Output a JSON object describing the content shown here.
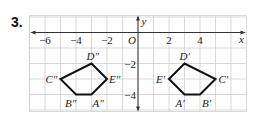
{
  "problem": {
    "number": "3."
  },
  "colors": {
    "grid": "#cfcfcf",
    "axis": "#333333",
    "shape": "#111111",
    "label": "#222222"
  },
  "chart_data": {
    "type": "coordinate-plane",
    "grid": {
      "x_min": -7,
      "x_max": 7,
      "y_min": -5,
      "y_max": 1,
      "on": true
    },
    "axes": {
      "x_label": "x",
      "y_label": "y",
      "origin_label": "O"
    },
    "x_tick_labels": [
      {
        "value": -6,
        "label": "−6"
      },
      {
        "value": -4,
        "label": "−4"
      },
      {
        "value": -2,
        "label": "−2"
      },
      {
        "value": 2,
        "label": "2"
      },
      {
        "value": 4,
        "label": "4"
      }
    ],
    "y_tick_labels": [
      {
        "value": -2,
        "label": "−2"
      },
      {
        "value": -4,
        "label": "−4"
      }
    ],
    "polygons": [
      {
        "name": "A′B′C′D′E′",
        "vertices": [
          {
            "label": "A′",
            "x": 3,
            "y": -4,
            "lx": -9,
            "ly": 12
          },
          {
            "label": "B′",
            "x": 4,
            "y": -4,
            "lx": 2,
            "ly": 12
          },
          {
            "label": "C′",
            "x": 5,
            "y": -3,
            "lx": 3,
            "ly": 4
          },
          {
            "label": "D′",
            "x": 3,
            "y": -2,
            "lx": -5,
            "ly": -4
          },
          {
            "label": "E′",
            "x": 2,
            "y": -3,
            "lx": -13,
            "ly": 4
          }
        ]
      },
      {
        "name": "A″B″C″D″E″",
        "vertices": [
          {
            "label": "A″",
            "x": -3,
            "y": -4,
            "lx": 1,
            "ly": 12
          },
          {
            "label": "B″",
            "x": -4,
            "y": -4,
            "lx": -11,
            "ly": 12
          },
          {
            "label": "C″",
            "x": -5,
            "y": -3,
            "lx": -15,
            "ly": 4
          },
          {
            "label": "D″",
            "x": -3,
            "y": -2,
            "lx": -5,
            "ly": -4
          },
          {
            "label": "E″",
            "x": -2,
            "y": -3,
            "lx": 2,
            "ly": 4
          }
        ]
      }
    ]
  }
}
